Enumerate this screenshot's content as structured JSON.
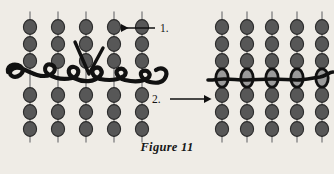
{
  "figure": {
    "caption": "Figure 11",
    "background_color": "#efece6",
    "width": 334,
    "height": 174
  },
  "steps": [
    {
      "id": "step-1",
      "label": "1.",
      "arrow_direction": "left",
      "arrow_color": "#111111",
      "points_to": "left-panel"
    },
    {
      "id": "step-2",
      "label": "2.",
      "arrow_direction": "right",
      "arrow_color": "#111111",
      "points_to": "right-panel"
    }
  ],
  "panels": [
    {
      "id": "left-panel",
      "name": "loose-weave-panel",
      "strand_count": 5,
      "beads_per_strand": 7,
      "woven_row_index": 3,
      "thread_state": "loose",
      "thread_color": "#111111",
      "bead_fill": "#575757",
      "bead_stroke": "#2b2b2b",
      "strand_color": "#8d8d8d"
    },
    {
      "id": "right-panel",
      "name": "tightened-weave-panel",
      "strand_count": 5,
      "beads_per_strand": 7,
      "woven_row_index": 3,
      "thread_state": "tightened",
      "thread_color": "#111111",
      "bead_fill": "#575757",
      "bead_stroke": "#2b2b2b",
      "strand_color": "#8d8d8d",
      "woven_bead_fill": "#9a9a9a",
      "woven_bead_stroke": "#111111"
    }
  ],
  "geometry": {
    "left_panel_x": [
      30,
      58,
      86,
      114,
      142
    ],
    "right_panel_x": [
      231,
      259,
      287,
      315,
      343
    ],
    "bead_rows_y": [
      27,
      44,
      61,
      78,
      95,
      112,
      129
    ],
    "bead_rx": 6.6,
    "bead_ry": 7.4,
    "strand_top_y": 12,
    "strand_bottom_y": 142
  }
}
